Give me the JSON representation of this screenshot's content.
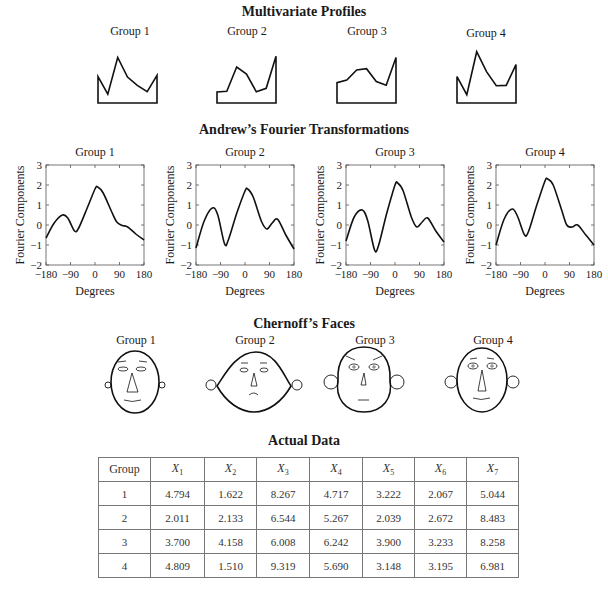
{
  "titles": {
    "profiles": "Multivariate Profiles",
    "fourier": "Andrew’s Fourier Transformations",
    "faces": "Chernoff’s Faces",
    "table": "Actual Data"
  },
  "groups": [
    "Group 1",
    "Group 2",
    "Group 3",
    "Group 4"
  ],
  "fourier_axes": {
    "ylabel": "Fourier Components",
    "xlabel": "Degrees",
    "xticks": [
      "−180",
      "−90",
      "0",
      "90",
      "180"
    ],
    "yticks": [
      "3",
      "2",
      "1",
      "0",
      "−1",
      "−2"
    ]
  },
  "table": {
    "header_group": "Group",
    "variables": [
      {
        "base": "X",
        "sub": "1"
      },
      {
        "base": "X",
        "sub": "2"
      },
      {
        "base": "X",
        "sub": "3"
      },
      {
        "base": "X",
        "sub": "4"
      },
      {
        "base": "X",
        "sub": "5"
      },
      {
        "base": "X",
        "sub": "6"
      },
      {
        "base": "X",
        "sub": "7"
      }
    ],
    "rows": [
      {
        "group": "1",
        "values": [
          "4.794",
          "1.622",
          "8.267",
          "4.717",
          "3.222",
          "2.067",
          "5.044"
        ]
      },
      {
        "group": "2",
        "values": [
          "2.011",
          "2.133",
          "6.544",
          "5.267",
          "2.039",
          "2.672",
          "8.483"
        ]
      },
      {
        "group": "3",
        "values": [
          "3.700",
          "4.158",
          "6.008",
          "6.242",
          "3.900",
          "3.233",
          "8.258"
        ]
      },
      {
        "group": "4",
        "values": [
          "4.809",
          "1.510",
          "9.319",
          "5.690",
          "3.148",
          "3.195",
          "6.981"
        ]
      }
    ]
  },
  "chart_data": [
    {
      "type": "line",
      "title": "Multivariate Profiles",
      "categories": [
        "X1",
        "X2",
        "X3",
        "X4",
        "X5",
        "X6",
        "X7"
      ],
      "series": [
        {
          "name": "Group 1",
          "values": [
            4.794,
            1.622,
            8.267,
            4.717,
            3.222,
            2.067,
            5.044
          ]
        },
        {
          "name": "Group 2",
          "values": [
            2.011,
            2.133,
            6.544,
            5.267,
            2.039,
            2.672,
            8.483
          ]
        },
        {
          "name": "Group 3",
          "values": [
            3.7,
            4.158,
            6.008,
            6.242,
            3.9,
            3.233,
            8.258
          ]
        },
        {
          "name": "Group 4",
          "values": [
            4.809,
            1.51,
            9.319,
            5.69,
            3.148,
            3.195,
            6.981
          ]
        }
      ],
      "xlabel": "",
      "ylabel": "",
      "grid": false
    },
    {
      "type": "line",
      "title": "Andrew’s Fourier Transformations",
      "x": [
        -180,
        -150,
        -120,
        -100,
        -75,
        -60,
        -30,
        0,
        10,
        30,
        60,
        80,
        100,
        120,
        150,
        180
      ],
      "series": [
        {
          "name": "Group 1",
          "values": [
            -0.65,
            0.1,
            0.5,
            0.35,
            -0.3,
            -0.15,
            0.8,
            1.8,
            1.9,
            1.6,
            0.7,
            0.15,
            -0.02,
            -0.1,
            -0.45,
            -0.75
          ]
        },
        {
          "name": "Group 2",
          "values": [
            -1.15,
            0.2,
            0.85,
            0.5,
            -0.95,
            -0.7,
            0.6,
            1.7,
            1.8,
            1.4,
            0.2,
            -0.2,
            0.1,
            0.28,
            -0.5,
            -1.2
          ]
        },
        {
          "name": "Group 3",
          "values": [
            -0.8,
            0.4,
            0.75,
            0.2,
            -1.25,
            -1.0,
            0.6,
            2.0,
            2.1,
            1.7,
            0.4,
            -0.1,
            0.15,
            0.35,
            -0.3,
            -0.85
          ]
        },
        {
          "name": "Group 4",
          "values": [
            -1.0,
            0.3,
            0.8,
            0.4,
            -0.5,
            -0.3,
            1.0,
            2.2,
            2.3,
            2.0,
            0.8,
            0.0,
            -0.1,
            0.0,
            -0.5,
            -1.0
          ]
        }
      ],
      "xlabel": "Degrees",
      "ylabel": "Fourier Components",
      "xlim": [
        -180,
        180
      ],
      "ylim": [
        -2,
        3
      ],
      "grid": false
    },
    {
      "type": "table",
      "title": "Actual Data",
      "columns": [
        "Group",
        "X1",
        "X2",
        "X3",
        "X4",
        "X5",
        "X6",
        "X7"
      ],
      "rows": [
        [
          "1",
          4.794,
          1.622,
          8.267,
          4.717,
          3.222,
          2.067,
          5.044
        ],
        [
          "2",
          2.011,
          2.133,
          6.544,
          5.267,
          2.039,
          2.672,
          8.483
        ],
        [
          "3",
          3.7,
          4.158,
          6.008,
          6.242,
          3.9,
          3.233,
          8.258
        ],
        [
          "4",
          4.809,
          1.51,
          9.319,
          5.69,
          3.148,
          3.195,
          6.981
        ]
      ]
    }
  ]
}
